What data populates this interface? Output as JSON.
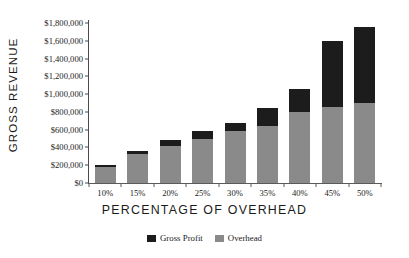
{
  "chart_data": {
    "type": "bar",
    "subtype": "stacked-vertical",
    "title": "",
    "xlabel": "PERCENTAGE OF OVERHEAD",
    "ylabel": "GROSS REVENUE",
    "categories": [
      "10%",
      "15%",
      "20%",
      "25%",
      "30%",
      "35%",
      "40%",
      "45%",
      "50%"
    ],
    "series": [
      {
        "name": "Overhead",
        "color": "#8a8a8a",
        "values": [
          180000,
          330000,
          420000,
          500000,
          580000,
          640000,
          800000,
          860000,
          900000
        ]
      },
      {
        "name": "Gross Profit",
        "color": "#1c1c1c",
        "values": [
          20000,
          30000,
          60000,
          80000,
          100000,
          200000,
          260000,
          740000,
          860000
        ]
      }
    ],
    "totals": [
      200000,
      360000,
      480000,
      580000,
      680000,
      840000,
      1060000,
      1600000,
      1760000
    ],
    "ylim": [
      0,
      1800000
    ],
    "ytick_values": [
      0,
      200000,
      400000,
      600000,
      800000,
      1000000,
      1200000,
      1400000,
      1600000,
      1800000
    ],
    "ytick_labels": [
      "$0",
      "$200,000",
      "$400,000",
      "$600,000",
      "$800,000",
      "$1,000,000",
      "$1,200,000",
      "$1,400,000",
      "$1,600,000",
      "$1,800,000"
    ],
    "grid": false,
    "legend_position": "bottom-center",
    "legend_order": [
      "Gross Profit",
      "Overhead"
    ]
  },
  "axes": {
    "y_title": "GROSS REVENUE",
    "x_title": "PERCENTAGE OF OVERHEAD"
  },
  "legend": {
    "items": [
      {
        "label": "Gross Profit",
        "color": "#1c1c1c"
      },
      {
        "label": "Overhead",
        "color": "#8a8a8a"
      }
    ]
  },
  "colors": {
    "gross_profit": "#1c1c1c",
    "overhead": "#8a8a8a",
    "axis": "#4a4a4a",
    "text": "#1b1b1b",
    "background": "#ffffff"
  }
}
